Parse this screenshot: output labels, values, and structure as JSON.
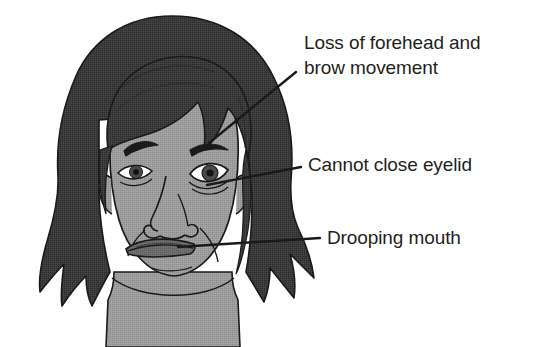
{
  "figure": {
    "name": "facial-nerve-palsy-diagram",
    "background_color": "#ffffff",
    "subject": {
      "name": "patient-face",
      "description": "Front-facing illustration of a person's head and shoulders showing one-sided facial droop"
    },
    "colors": {
      "background": "#ffffff",
      "hair": "#3c3c3c",
      "hair_shadow": "#323232",
      "skin": "#9c9c9c",
      "skin_shadow": "#8e8e8e",
      "outline": "#1a1a1a",
      "eye_white": "#ffffff",
      "iris": "#4a4a4a",
      "pupil": "#1a1a1a",
      "lip": "#6f6f6f",
      "text": "#231f20",
      "leader_line": "#1a1a1a"
    }
  },
  "callouts": [
    {
      "id": "forehead",
      "label": "Loss of forehead and\nbrow movement",
      "lines": [
        "Loss of forehead and",
        "brow movement"
      ],
      "points_to": "right-eyebrow-and-forehead"
    },
    {
      "id": "eyelid",
      "label": "Cannot close eyelid",
      "lines": [
        "Cannot close eyelid"
      ],
      "points_to": "right-lower-eyelid"
    },
    {
      "id": "mouth",
      "label": "Drooping mouth",
      "lines": [
        "Drooping mouth"
      ],
      "points_to": "mouth-corner"
    }
  ]
}
